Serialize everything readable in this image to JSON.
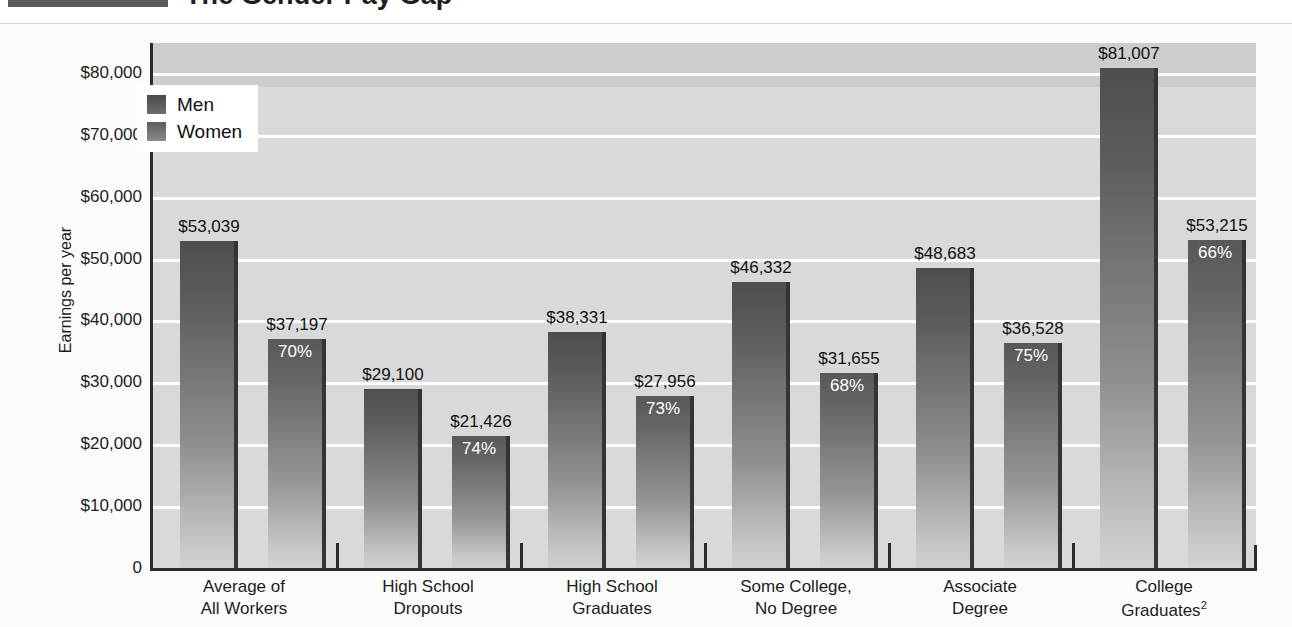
{
  "title": "The Gender Pay Gap",
  "figure": {
    "y_axis_title": "Earnings per year",
    "y_ticks": [
      "$80,000",
      "$70,000",
      "$60,000",
      "$50,000",
      "$40,000",
      "$30,000",
      "$20,000",
      "$10,000",
      "0"
    ],
    "legend": [
      {
        "label": "Men",
        "swatch": "men-swatch"
      },
      {
        "label": "Women",
        "swatch": "women-swatch"
      }
    ]
  },
  "chart_data": {
    "type": "bar",
    "title": "The Gender Pay Gap",
    "xlabel": "",
    "ylabel": "Earnings per year",
    "ylim": [
      0,
      85000
    ],
    "yticks": [
      0,
      10000,
      20000,
      30000,
      40000,
      50000,
      60000,
      70000,
      80000
    ],
    "ytick_labels": [
      "0",
      "$10,000",
      "$20,000",
      "$30,000",
      "$40,000",
      "$50,000",
      "$60,000",
      "$70,000",
      "$80,000"
    ],
    "grid": true,
    "legend_position": "upper-left-inside",
    "categories": [
      "Average of\nAll Workers",
      "High School\nDropouts",
      "High School\nGraduates",
      "Some College,\nNo Degree",
      "Associate\nDegree",
      "College\nGraduates²"
    ],
    "series": [
      {
        "name": "Men",
        "values": [
          53039,
          29100,
          38331,
          46332,
          48683,
          81007
        ],
        "labels": [
          "$53,039",
          "$29,100",
          "$38,331",
          "$46,332",
          "$48,683",
          "$81,007"
        ]
      },
      {
        "name": "Women",
        "values": [
          37197,
          21426,
          27956,
          31655,
          36528,
          53215
        ],
        "labels": [
          "$37,197",
          "$21,426",
          "$27,956",
          "$31,655",
          "$36,528",
          "$53,215"
        ],
        "pct_of_men": [
          "70%",
          "74%",
          "73%",
          "68%",
          "75%",
          "66%"
        ]
      }
    ],
    "annotations": "Women's bars are labeled with their earnings as a percentage of men's earnings in the same category."
  },
  "categories_display": [
    {
      "line1": "Average of",
      "line2": "All Workers",
      "sup": ""
    },
    {
      "line1": "High School",
      "line2": "Dropouts",
      "sup": ""
    },
    {
      "line1": "High School",
      "line2": "Graduates",
      "sup": ""
    },
    {
      "line1": "Some College,",
      "line2": "No Degree",
      "sup": ""
    },
    {
      "line1": "Associate",
      "line2": "Degree",
      "sup": ""
    },
    {
      "line1": "College",
      "line2": "Graduates",
      "sup": "2"
    }
  ]
}
